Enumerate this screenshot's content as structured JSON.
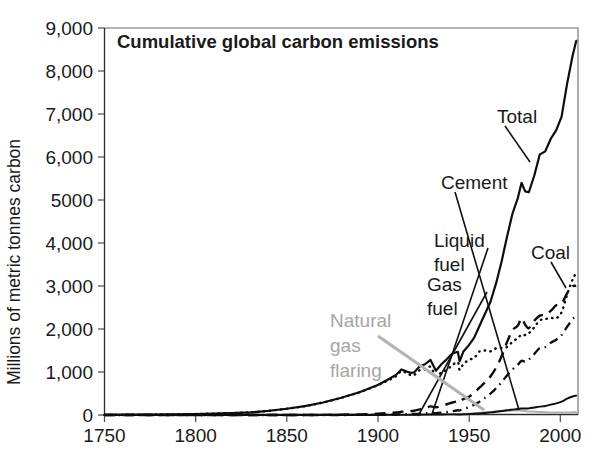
{
  "chart_data": {
    "type": "line",
    "title": "Cumulative global carbon emissions",
    "xlabel": "",
    "ylabel": "Millions of metric tonnes carbon",
    "xlim": [
      1750,
      2010
    ],
    "ylim": [
      0,
      9000
    ],
    "grid": false,
    "legend_position": "inline-annotations",
    "xticks": [
      "1750",
      "1800",
      "1850",
      "1900",
      "1950",
      "2000"
    ],
    "xtick_values": [
      1750,
      1800,
      1850,
      1900,
      1950,
      2000
    ],
    "yticks": [
      "0",
      "1,000",
      "2,000",
      "3,000",
      "4,000",
      "5000",
      "6,000",
      "7,000",
      "8,000",
      "9,000"
    ],
    "ytick_values": [
      0,
      1000,
      2000,
      3000,
      4000,
      5000,
      6000,
      7000,
      8000,
      9000
    ],
    "x": [
      1750,
      1760,
      1770,
      1780,
      1790,
      1800,
      1810,
      1820,
      1830,
      1840,
      1850,
      1860,
      1870,
      1880,
      1890,
      1900,
      1905,
      1910,
      1913,
      1916,
      1918,
      1920,
      1923,
      1926,
      1929,
      1932,
      1935,
      1938,
      1941,
      1944,
      1945,
      1947,
      1950,
      1953,
      1956,
      1959,
      1962,
      1965,
      1968,
      1971,
      1974,
      1977,
      1979,
      1981,
      1983,
      1986,
      1989,
      1992,
      1995,
      1998,
      2001,
      2004,
      2007,
      2009
    ],
    "series": [
      {
        "name": "Total",
        "style": "solid",
        "color": "#0d0d0d",
        "values": [
          3,
          5,
          8,
          11,
          15,
          22,
          32,
          45,
          62,
          95,
          145,
          205,
          290,
          400,
          530,
          700,
          810,
          930,
          1060,
          1010,
          980,
          990,
          1130,
          1180,
          1280,
          1030,
          1180,
          1300,
          1430,
          1470,
          1250,
          1470,
          1620,
          1800,
          2080,
          2360,
          2640,
          3060,
          3560,
          4140,
          4680,
          5050,
          5400,
          5200,
          5180,
          5570,
          6060,
          6130,
          6420,
          6620,
          6940,
          7700,
          8350,
          8700
        ]
      },
      {
        "name": "Coal",
        "style": "dotted",
        "color": "#0d0d0d",
        "values": [
          3,
          5,
          8,
          11,
          15,
          22,
          32,
          45,
          62,
          95,
          145,
          205,
          290,
          400,
          530,
          690,
          790,
          900,
          1020,
          970,
          930,
          930,
          1040,
          1060,
          1120,
          900,
          990,
          1050,
          1160,
          1230,
          1050,
          1180,
          1280,
          1330,
          1480,
          1500,
          1480,
          1550,
          1560,
          1580,
          1700,
          1790,
          1870,
          1860,
          1900,
          2040,
          2200,
          2230,
          2260,
          2250,
          2390,
          2800,
          3150,
          3300
        ]
      },
      {
        "name": "Liquid fuel",
        "style": "dashed",
        "color": "#0d0d0d",
        "values": [
          0,
          0,
          0,
          0,
          0,
          0,
          0,
          0,
          0,
          0,
          0,
          1,
          3,
          8,
          15,
          30,
          42,
          58,
          75,
          82,
          90,
          100,
          130,
          160,
          200,
          180,
          210,
          250,
          290,
          320,
          300,
          370,
          420,
          520,
          640,
          760,
          900,
          1100,
          1360,
          1690,
          1970,
          2080,
          2250,
          2100,
          2020,
          2190,
          2310,
          2330,
          2420,
          2550,
          2590,
          2830,
          2990,
          3000
        ]
      },
      {
        "name": "Gas fuel",
        "style": "dash-dot",
        "color": "#0d0d0d",
        "values": [
          0,
          0,
          0,
          0,
          0,
          0,
          0,
          0,
          0,
          0,
          0,
          0,
          0,
          0,
          2,
          5,
          8,
          12,
          16,
          18,
          20,
          23,
          30,
          38,
          48,
          45,
          55,
          70,
          90,
          110,
          105,
          140,
          180,
          240,
          310,
          400,
          500,
          620,
          760,
          920,
          1060,
          1170,
          1260,
          1240,
          1290,
          1420,
          1560,
          1580,
          1680,
          1750,
          1860,
          2050,
          2230,
          2300
        ]
      },
      {
        "name": "Cement",
        "style": "solid-thin",
        "color": "#0d0d0d",
        "values": [
          0,
          0,
          0,
          0,
          0,
          0,
          0,
          0,
          0,
          0,
          0,
          0,
          0,
          0,
          0,
          1,
          2,
          3,
          4,
          4,
          4,
          5,
          7,
          9,
          11,
          8,
          11,
          14,
          14,
          12,
          10,
          16,
          20,
          28,
          38,
          48,
          60,
          75,
          92,
          110,
          125,
          140,
          150,
          150,
          155,
          175,
          195,
          210,
          240,
          270,
          310,
          380,
          430,
          450
        ]
      },
      {
        "name": "Natural gas flaring",
        "style": "solid-gray",
        "color": "#b0b0b0",
        "values": [
          0,
          0,
          0,
          0,
          0,
          0,
          0,
          0,
          0,
          0,
          0,
          0,
          0,
          0,
          1,
          2,
          3,
          4,
          5,
          5,
          6,
          7,
          9,
          11,
          14,
          13,
          15,
          18,
          21,
          24,
          22,
          28,
          33,
          42,
          52,
          62,
          72,
          82,
          92,
          100,
          105,
          105,
          100,
          92,
          84,
          76,
          70,
          64,
          60,
          58,
          58,
          60,
          62,
          62
        ]
      }
    ],
    "annotations": [
      {
        "label": "Total",
        "series": "Total"
      },
      {
        "label": "Cement",
        "series": "Cement"
      },
      {
        "label": "Liquid\nfuel",
        "series": "Liquid fuel"
      },
      {
        "label": "Gas\nfuel",
        "series": "Gas fuel"
      },
      {
        "label": "Coal",
        "series": "Coal"
      },
      {
        "label": "Natural\ngas\nflaring",
        "series": "Natural gas flaring"
      }
    ]
  },
  "labels": {
    "title": "Cumulative global carbon emissions",
    "ylabel": "Millions of metric tonnes carbon",
    "total": "Total",
    "cement": "Cement",
    "liquid1": "Liquid",
    "liquid2": "fuel",
    "gas1": "Gas",
    "gas2": "fuel",
    "coal": "Coal",
    "flaring1": "Natural",
    "flaring2": "gas",
    "flaring3": "flaring",
    "y0": "0",
    "y1": "1,000",
    "y2": "2,000",
    "y3": "3,000",
    "y4": "4,000",
    "y5": "5000",
    "y6": "6,000",
    "y7": "7,000",
    "y8": "8,000",
    "y9": "9,000",
    "x0": "1750",
    "x1": "1800",
    "x2": "1850",
    "x3": "1900",
    "x4": "1950",
    "x5": "2000"
  },
  "colors": {
    "line": "#0d0d0d",
    "flaring": "#b0b0b0",
    "axis": "#2b2b2b",
    "frame": "#6b6b6b",
    "text": "#1a1a1a"
  }
}
